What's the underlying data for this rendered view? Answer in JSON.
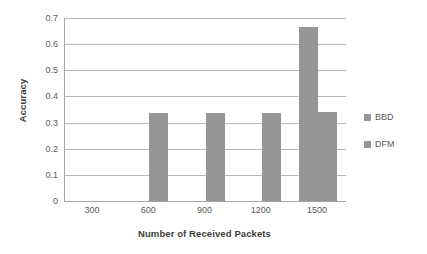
{
  "chart_data": {
    "type": "bar",
    "title": "",
    "xlabel": "Number of Received Packets",
    "ylabel": "Accuracy",
    "categories": [
      "300",
      "600",
      "900",
      "1200",
      "1500"
    ],
    "series": [
      {
        "name": "BBD",
        "values": [
          0,
          0,
          0,
          0,
          0.665
        ],
        "color": "#969696"
      },
      {
        "name": "DFM",
        "values": [
          0,
          0.335,
          0.337,
          0.337,
          0.34
        ],
        "color": "#969696"
      }
    ],
    "ylim": [
      0,
      0.7
    ],
    "ytick_step": 0.1,
    "yticks": [
      "0.7",
      "0.6",
      "0.5",
      "0.4",
      "0.3",
      "0.2",
      "0.1",
      "0"
    ],
    "ytick_values": [
      0.7,
      0.6,
      0.5,
      0.4,
      0.3,
      0.2,
      0.1,
      0
    ],
    "grid": true,
    "legend_position": "right"
  },
  "colors": {
    "bar": "#969696",
    "gridline": "#b9b9b9",
    "axis": "#a6a6a6",
    "text": "#5a5a5a",
    "title_text": "#3d3d3d",
    "background": "#ffffff"
  }
}
